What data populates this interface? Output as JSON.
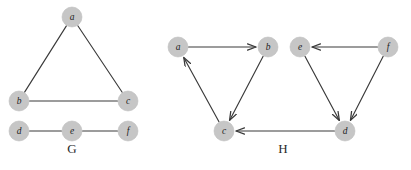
{
  "figure": {
    "width": 411,
    "height": 170,
    "background_color": "#ffffff",
    "node_fill_color": "#c6c6c6",
    "edge_color": "#3a3a3a",
    "label_color": "#1c1c1c",
    "node_radius": 10
  },
  "graphs": [
    {
      "id": "G",
      "caption": "G",
      "caption_position": {
        "x": 72,
        "y": 153
      },
      "type": "undirected",
      "directed": false,
      "nodes": [
        {
          "id": "a",
          "label": "a",
          "x": 72,
          "y": 17
        },
        {
          "id": "b",
          "label": "b",
          "x": 19,
          "y": 101
        },
        {
          "id": "c",
          "label": "c",
          "x": 128,
          "y": 101
        },
        {
          "id": "d",
          "label": "d",
          "x": 19,
          "y": 131
        },
        {
          "id": "e",
          "label": "e",
          "x": 72,
          "y": 131
        },
        {
          "id": "f",
          "label": "f",
          "x": 128,
          "y": 131
        }
      ],
      "edges": [
        {
          "from": "a",
          "to": "b",
          "label": "a-b"
        },
        {
          "from": "a",
          "to": "c",
          "label": "a-c"
        },
        {
          "from": "b",
          "to": "c",
          "label": "b-c"
        },
        {
          "from": "d",
          "to": "e",
          "label": "d-e"
        },
        {
          "from": "e",
          "to": "f",
          "label": "e-f"
        }
      ]
    },
    {
      "id": "H",
      "caption": "H",
      "caption_position": {
        "x": 283,
        "y": 153
      },
      "type": "directed",
      "directed": true,
      "nodes": [
        {
          "id": "a",
          "label": "a",
          "x": 178,
          "y": 47
        },
        {
          "id": "b",
          "label": "b",
          "x": 268,
          "y": 47
        },
        {
          "id": "c",
          "label": "c",
          "x": 224,
          "y": 131
        },
        {
          "id": "e",
          "label": "e",
          "x": 300,
          "y": 47
        },
        {
          "id": "f",
          "label": "f",
          "x": 388,
          "y": 47
        },
        {
          "id": "d",
          "label": "d",
          "x": 345,
          "y": 131
        }
      ],
      "edges": [
        {
          "from": "a",
          "to": "b",
          "label": "a-to-b"
        },
        {
          "from": "b",
          "to": "c",
          "label": "b-to-c"
        },
        {
          "from": "c",
          "to": "a",
          "label": "c-to-a"
        },
        {
          "from": "f",
          "to": "e",
          "label": "f-to-e"
        },
        {
          "from": "e",
          "to": "d",
          "label": "e-to-d"
        },
        {
          "from": "f",
          "to": "d",
          "label": "f-to-d"
        },
        {
          "from": "d",
          "to": "c",
          "label": "d-to-c"
        }
      ]
    }
  ]
}
